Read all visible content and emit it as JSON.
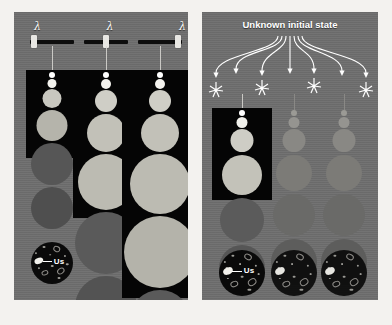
{
  "figure": {
    "background_color": "#f3f2ef",
    "panel_color": "#6e6e6e",
    "cone_color": "#050505",
    "accent_color": "#ffffff"
  },
  "left_panel": {
    "name": "tunable-lambda-panel",
    "sliders": [
      {
        "symbol": "λ",
        "handle_percent": 8,
        "label": "lambda-slider-1"
      },
      {
        "symbol": "λ",
        "handle_percent": 50,
        "label": "lambda-slider-2"
      },
      {
        "symbol": "λ",
        "handle_percent": 92,
        "label": "lambda-slider-3"
      }
    ],
    "columns": [
      {
        "name": "column-small-lambda",
        "cone_height": 88,
        "bubbles": [
          {
            "d": 6,
            "color": "#ffffff"
          },
          {
            "d": 9,
            "color": "#f4f3ee"
          },
          {
            "d": 19,
            "color": "#c8c7bf"
          },
          {
            "d": 31,
            "color": "#b5b4ab"
          },
          {
            "d": 42,
            "color": "#565656"
          },
          {
            "d": 42,
            "color": "#4f4f4f"
          }
        ],
        "us_label": "Us"
      },
      {
        "name": "column-medium-lambda",
        "cone_height": 148,
        "bubbles": [
          {
            "d": 6,
            "color": "#ffffff"
          },
          {
            "d": 10,
            "color": "#f4f3ee"
          },
          {
            "d": 22,
            "color": "#cfcec6"
          },
          {
            "d": 38,
            "color": "#c2c1b8"
          },
          {
            "d": 56,
            "color": "#bcbbb2"
          },
          {
            "d": 62,
            "color": "#5a5a5a"
          },
          {
            "d": 62,
            "color": "#535353"
          }
        ],
        "us_label": "Us"
      },
      {
        "name": "column-large-lambda",
        "cone_height": 228,
        "bubbles": [
          {
            "d": 6,
            "color": "#ffffff"
          },
          {
            "d": 10,
            "color": "#f4f3ee"
          },
          {
            "d": 22,
            "color": "#cfcec6"
          },
          {
            "d": 38,
            "color": "#c2c1b8"
          },
          {
            "d": 60,
            "color": "#bcbbb2"
          },
          {
            "d": 72,
            "color": "#b4b3aa"
          },
          {
            "d": 62,
            "color": "#5a5a5a"
          }
        ],
        "us_label": "Us"
      }
    ]
  },
  "right_panel": {
    "name": "unknown-initial-state-panel",
    "title": "Unknown initial state",
    "arrow_count": 7,
    "burst_positions": [
      1,
      3,
      5,
      7
    ],
    "columns": [
      {
        "name": "column-highlighted",
        "active": true,
        "cone_height": 92,
        "bubbles": [
          {
            "d": 6,
            "color": "#ffffff"
          },
          {
            "d": 11,
            "color": "#f1f0eb"
          },
          {
            "d": 23,
            "color": "#cecdc5"
          },
          {
            "d": 40,
            "color": "#c3c2b9"
          },
          {
            "d": 44,
            "color": "#5b5b5b"
          },
          {
            "d": 46,
            "color": "#565656"
          }
        ],
        "us_label": "Us"
      },
      {
        "name": "column-dimmed-1",
        "active": false,
        "cone_height": 0,
        "bubbles": [
          {
            "d": 6,
            "color": "#9b9a95"
          },
          {
            "d": 11,
            "color": "#959490"
          },
          {
            "d": 23,
            "color": "#898884"
          },
          {
            "d": 36,
            "color": "#7c7b77"
          },
          {
            "d": 42,
            "color": "#6a6a68"
          },
          {
            "d": 46,
            "color": "#5d5d5c"
          }
        ],
        "us_label": ""
      },
      {
        "name": "column-dimmed-2",
        "active": false,
        "cone_height": 0,
        "bubbles": [
          {
            "d": 6,
            "color": "#9b9a95"
          },
          {
            "d": 11,
            "color": "#959490"
          },
          {
            "d": 23,
            "color": "#898884"
          },
          {
            "d": 36,
            "color": "#7c7b77"
          },
          {
            "d": 42,
            "color": "#6a6a68"
          },
          {
            "d": 46,
            "color": "#5d5d5c"
          }
        ],
        "us_label": ""
      }
    ]
  }
}
